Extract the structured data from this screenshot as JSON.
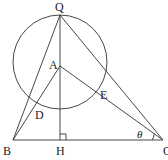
{
  "diagram": {
    "type": "geometry",
    "points": {
      "Q": {
        "label": "Q",
        "x": 60,
        "y": 15
      },
      "A": {
        "label": "A",
        "x": 60,
        "y": 66
      },
      "B": {
        "label": "B",
        "x": 13,
        "y": 140
      },
      "H": {
        "label": "H",
        "x": 60,
        "y": 140
      },
      "C": {
        "label": "C",
        "x": 163,
        "y": 140
      },
      "D": {
        "label": "D",
        "x": 36,
        "y": 108
      },
      "E": {
        "label": "E",
        "x": 101,
        "y": 91
      }
    },
    "circle": {
      "cx": 60,
      "cy": 62,
      "r": 47
    },
    "angle_label": "θ",
    "right_angle_at": "H"
  }
}
